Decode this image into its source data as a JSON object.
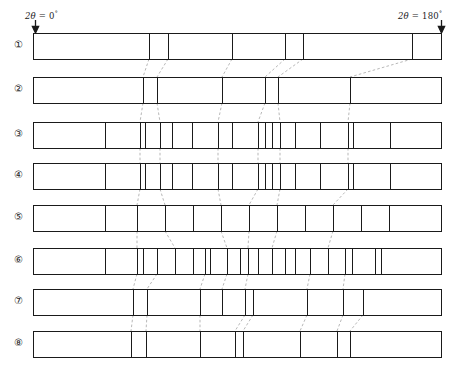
{
  "figure": {
    "axis_left_label": "2θ = 0°",
    "axis_right_label": "2θ = 180°",
    "axis_left_symbol": "2θ",
    "axis_left_value": "0",
    "axis_right_value": "180",
    "axis_unit": "°",
    "left_arrow_icon": "down-arrow-icon",
    "right_arrow_icon": "down-arrow-icon",
    "bar_stroke_color": "#1a1a1a",
    "bar_fill_color": "#ffffff",
    "peak_color": "#1a1a1a",
    "connector_color": "#9a9a9a",
    "plot_x_start": 33,
    "plot_x_end": 441,
    "bar_height": 26,
    "row_count": 8
  },
  "chart_data": {
    "type": "bar",
    "xlabel": "2θ",
    "ylabel": "",
    "xlim": [
      0,
      180
    ],
    "grid": false,
    "legend": "none",
    "x_tick_labels": [
      "2θ = 0°",
      "2θ = 180°"
    ],
    "categories": [
      "①",
      "②",
      "③",
      "④",
      "⑤",
      "⑥",
      "⑦",
      "⑧"
    ],
    "note": "Each row is a diffraction strip; values are peak positions in pixel x-coordinates across the strip.",
    "series": [
      {
        "name": "①",
        "label": "①",
        "peaks": [
          149,
          168,
          232,
          285,
          303,
          412
        ]
      },
      {
        "name": "②",
        "label": "②",
        "peaks": [
          143,
          157,
          222,
          265,
          278,
          350
        ]
      },
      {
        "name": "③",
        "label": "③",
        "peaks": [
          105,
          140,
          145,
          160,
          172,
          192,
          218,
          232,
          258,
          265,
          272,
          280,
          295,
          320,
          348,
          353,
          390
        ]
      },
      {
        "name": "④",
        "label": "④",
        "peaks": [
          105,
          140,
          145,
          160,
          172,
          192,
          218,
          232,
          258,
          265,
          272,
          280,
          295,
          320,
          348,
          353,
          390
        ]
      },
      {
        "name": "⑤",
        "label": "⑤",
        "peaks": [
          105,
          137,
          165,
          193,
          221,
          249,
          277,
          305,
          333,
          361,
          389
        ]
      },
      {
        "name": "⑥",
        "label": "⑥",
        "peaks": [
          105,
          137,
          143,
          157,
          175,
          193,
          205,
          210,
          227,
          240,
          248,
          258,
          272,
          285,
          295,
          310,
          328,
          345,
          352,
          375,
          381
        ]
      },
      {
        "name": "⑦",
        "label": "⑦",
        "peaks": [
          133,
          147,
          200,
          222,
          245,
          253,
          307,
          343,
          363
        ]
      },
      {
        "name": "⑧",
        "label": "⑧",
        "peaks": [
          131,
          146,
          200,
          235,
          243,
          300,
          337,
          350
        ]
      }
    ],
    "connectors": [
      {
        "from_row": 1,
        "to_row": 2,
        "pairs": [
          [
            149,
            143
          ],
          [
            168,
            157
          ],
          [
            232,
            222
          ],
          [
            285,
            265
          ],
          [
            303,
            278
          ],
          [
            412,
            350
          ]
        ]
      },
      {
        "from_row": 2,
        "to_row": 3,
        "pairs": [
          [
            143,
            140
          ],
          [
            157,
            160
          ],
          [
            222,
            218
          ],
          [
            265,
            258
          ],
          [
            278,
            280
          ],
          [
            350,
            348
          ]
        ]
      },
      {
        "from_row": 3,
        "to_row": 4,
        "pairs": [
          [
            140,
            140
          ],
          [
            160,
            160
          ],
          [
            218,
            218
          ],
          [
            258,
            258
          ],
          [
            280,
            280
          ],
          [
            348,
            348
          ]
        ]
      },
      {
        "from_row": 4,
        "to_row": 5,
        "pairs": [
          [
            140,
            137
          ],
          [
            160,
            165
          ],
          [
            218,
            221
          ],
          [
            258,
            249
          ],
          [
            280,
            277
          ],
          [
            348,
            333
          ]
        ]
      },
      {
        "from_row": 5,
        "to_row": 6,
        "pairs": [
          [
            137,
            137
          ],
          [
            165,
            175
          ],
          [
            221,
            227
          ],
          [
            249,
            248
          ],
          [
            277,
            272
          ],
          [
            333,
            328
          ]
        ]
      },
      {
        "from_row": 6,
        "to_row": 7,
        "pairs": [
          [
            137,
            133
          ],
          [
            157,
            147
          ],
          [
            205,
            200
          ],
          [
            227,
            222
          ],
          [
            248,
            245
          ],
          [
            310,
            307
          ],
          [
            345,
            343
          ]
        ]
      },
      {
        "from_row": 7,
        "to_row": 8,
        "pairs": [
          [
            133,
            131
          ],
          [
            147,
            146
          ],
          [
            200,
            200
          ],
          [
            245,
            235
          ],
          [
            253,
            243
          ],
          [
            307,
            300
          ],
          [
            343,
            337
          ],
          [
            363,
            350
          ]
        ]
      }
    ]
  },
  "rows": [
    {
      "id": 1,
      "label": "①",
      "name": "diffraction-row-1"
    },
    {
      "id": 2,
      "label": "②",
      "name": "diffraction-row-2"
    },
    {
      "id": 3,
      "label": "③",
      "name": "diffraction-row-3"
    },
    {
      "id": 4,
      "label": "④",
      "name": "diffraction-row-4"
    },
    {
      "id": 5,
      "label": "⑤",
      "name": "diffraction-row-5"
    },
    {
      "id": 6,
      "label": "⑥",
      "name": "diffraction-row-6"
    },
    {
      "id": 7,
      "label": "⑦",
      "name": "diffraction-row-7"
    },
    {
      "id": 8,
      "label": "⑧",
      "name": "diffraction-row-8"
    }
  ]
}
